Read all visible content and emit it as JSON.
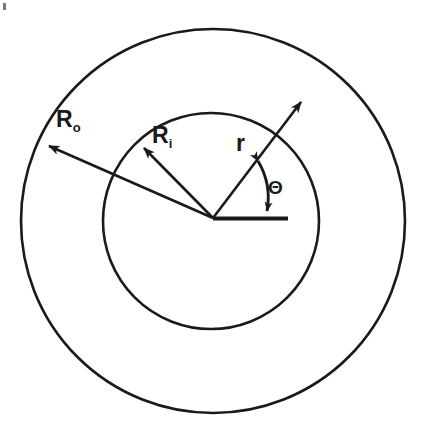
{
  "figure": {
    "background_color": "#ffffff",
    "line_color": "#1a1a1a",
    "labels": {
      "outer_radius": {
        "base": "R",
        "subscript": "o",
        "full": "Ro"
      },
      "inner_radius": {
        "base": "R",
        "subscript": "i",
        "full": "Ri"
      },
      "radial_coordinate": {
        "base": "r",
        "subscript": "",
        "full": "r"
      },
      "angle": {
        "base": "Θ",
        "subscript": "",
        "full": "Θ"
      }
    },
    "geometry": {
      "origin": {
        "x": 213,
        "y": 218
      },
      "outer_circle": {
        "cx": 213,
        "cy": 221,
        "r": 192
      },
      "inner_circle": {
        "cx": 211,
        "cy": 221,
        "r": 108
      },
      "baseline": {
        "x1": 213,
        "y1": 218,
        "x2": 288,
        "y2": 218
      },
      "arrows": [
        {
          "name": "outer-radius-arrow",
          "label": "Ro",
          "x1": 213,
          "y1": 218,
          "x2": 43,
          "y2": 143,
          "angle_deg": 156
        },
        {
          "name": "inner-radius-arrow",
          "label": "Ri",
          "x1": 213,
          "y1": 218,
          "x2": 138,
          "y2": 143,
          "angle_deg": 135
        },
        {
          "name": "radial-coordinate-arrow",
          "label": "r",
          "x1": 213,
          "y1": 218,
          "x2": 305,
          "y2": 96,
          "angle_deg": 53
        }
      ],
      "angle_arc": {
        "name": "theta-arc",
        "cx": 213,
        "cy": 218,
        "radius": 72,
        "start_angle_deg": 53,
        "end_angle_deg": 0,
        "double_headed": true
      }
    }
  }
}
